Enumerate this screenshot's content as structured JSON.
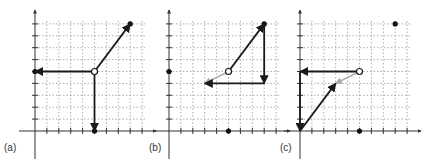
{
  "figure": {
    "unit_px": 11.9,
    "grid_cols": 9,
    "grid_rows": 9,
    "colors": {
      "axis": "#333333",
      "grid": "#9a9a9a",
      "vector": "#1a1a1a",
      "resultant": "#aaaaaa",
      "point": "#111111"
    },
    "panels": [
      {
        "label": "(a)",
        "origin_px": [
          35,
          131
        ],
        "label_px": [
          4,
          151
        ],
        "vectors": [
          {
            "from": [
              5,
              5
            ],
            "to": [
              8,
              9
            ],
            "style": "vector"
          },
          {
            "from": [
              5,
              5
            ],
            "to": [
              0,
              5
            ],
            "style": "vector"
          },
          {
            "from": [
              5,
              5
            ],
            "to": [
              5,
              0
            ],
            "style": "vector"
          }
        ],
        "open_points": [
          [
            5,
            5
          ]
        ],
        "dots": [
          [
            8,
            9
          ],
          [
            0,
            5
          ],
          [
            5,
            0
          ]
        ]
      },
      {
        "label": "(b)",
        "origin_px": [
          169,
          131
        ],
        "label_px": [
          149,
          151
        ],
        "vectors": [
          {
            "from": [
              5,
              5
            ],
            "to": [
              8,
              9
            ],
            "style": "vector"
          },
          {
            "from": [
              8,
              9
            ],
            "to": [
              8,
              4
            ],
            "style": "vector"
          },
          {
            "from": [
              8,
              4
            ],
            "to": [
              3,
              4
            ],
            "style": "vector"
          },
          {
            "from": [
              5,
              5
            ],
            "to": [
              3,
              4
            ],
            "style": "resultant"
          }
        ],
        "open_points": [
          [
            5,
            5
          ]
        ],
        "dots": [
          [
            8,
            9
          ],
          [
            0,
            5
          ],
          [
            5,
            0
          ]
        ]
      },
      {
        "label": "(c)",
        "origin_px": [
          300,
          131
        ],
        "label_px": [
          280,
          151
        ],
        "vectors": [
          {
            "from": [
              5,
              5
            ],
            "to": [
              0,
              5
            ],
            "style": "vector"
          },
          {
            "from": [
              0,
              5
            ],
            "to": [
              0,
              0
            ],
            "style": "vector"
          },
          {
            "from": [
              0,
              0
            ],
            "to": [
              3,
              4
            ],
            "style": "vector"
          },
          {
            "from": [
              5,
              5
            ],
            "to": [
              3,
              4
            ],
            "style": "resultant"
          }
        ],
        "open_points": [
          [
            5,
            5
          ]
        ],
        "dots": [
          [
            8,
            9
          ],
          [
            5,
            0
          ]
        ]
      }
    ]
  }
}
